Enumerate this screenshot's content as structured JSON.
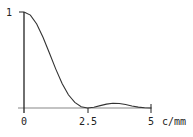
{
  "chart_data": {
    "type": "line",
    "title": "",
    "xlabel": "c/mm",
    "ylabel": "",
    "xlim": [
      0,
      5
    ],
    "ylim": [
      0,
      1
    ],
    "grid": false,
    "legend": null,
    "x_ticks": [
      {
        "value": 0,
        "label": "0"
      },
      {
        "value": 2.5,
        "label": "2.5"
      },
      {
        "value": 5,
        "label": "5"
      }
    ],
    "y_ticks": [
      {
        "value": 1,
        "label": "1"
      }
    ],
    "series": [
      {
        "name": "MTF",
        "color": "#333333",
        "x": [
          0,
          0.25,
          0.5,
          0.75,
          1.0,
          1.25,
          1.5,
          1.75,
          2.0,
          2.25,
          2.5,
          2.75,
          3.0,
          3.25,
          3.5,
          3.75,
          4.0,
          4.25,
          4.5,
          4.75,
          5.0
        ],
        "values": [
          1.0,
          0.968,
          0.875,
          0.737,
          0.573,
          0.405,
          0.255,
          0.138,
          0.058,
          0.012,
          0.0,
          0.008,
          0.025,
          0.041,
          0.05,
          0.047,
          0.036,
          0.021,
          0.009,
          0.002,
          0.0
        ]
      }
    ]
  },
  "axes": {
    "x_unit_label": "c/mm",
    "y_top_label": "1"
  }
}
